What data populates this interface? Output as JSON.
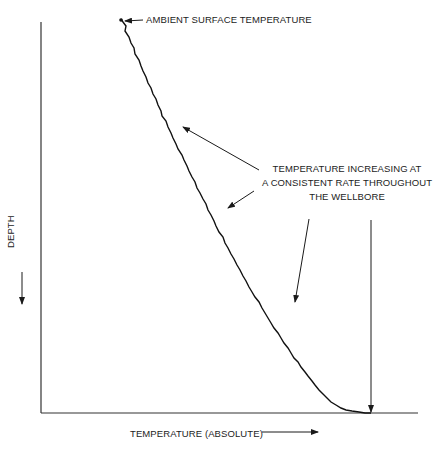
{
  "diagram": {
    "title": "",
    "x_axis": {
      "label": "TEMPERATURE (ABSOLUTE)",
      "direction_arrow": "right-arrow"
    },
    "y_axis": {
      "label": "DEPTH",
      "direction_arrow": "down-arrow"
    },
    "annotations": {
      "surface": "AMBIENT SURFACE TEMPERATURE",
      "gradient": {
        "lines": [
          "TEMPERATURE INCREASING AT",
          "A CONSISTENT RATE THROUGHOUT",
          "THE WELLBORE"
        ]
      }
    },
    "curve": {
      "description": "Temperature vs depth, linear increase from surface to bottom",
      "start": "ambient surface temperature at zero depth",
      "end": "maximum temperature at total depth"
    },
    "colors": {
      "line": "#1a1a1a",
      "background": "#ffffff"
    }
  }
}
